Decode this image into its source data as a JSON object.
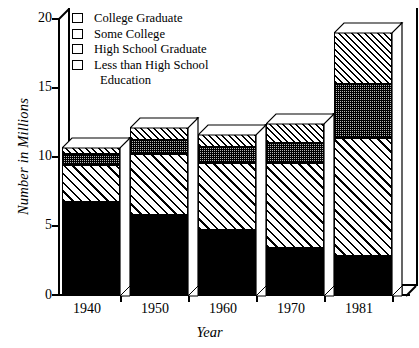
{
  "chart_data": {
    "type": "bar",
    "subtype": "stacked-bar-3d",
    "title": "",
    "xlabel": "Year",
    "ylabel": "Number in Millions",
    "categories": [
      "1940",
      "1950",
      "1960",
      "1970",
      "1981"
    ],
    "ylim": [
      0,
      20
    ],
    "yticks": [
      0,
      5,
      10,
      15,
      20
    ],
    "ytick_labels": [
      "0",
      "5",
      "10",
      "15",
      "20"
    ],
    "grid": false,
    "legend_position": "top-left",
    "stack_order_bottom_to_top": [
      "Less than High School Education",
      "High School Graduate",
      "Some College",
      "College Graduate"
    ],
    "series": [
      {
        "name": "Less than High School Education",
        "pattern": "solid-black",
        "values": [
          6.7,
          5.8,
          4.7,
          3.4,
          2.8
        ]
      },
      {
        "name": "High School Graduate",
        "pattern": "diagonal-hatch-medium",
        "values": [
          2.7,
          4.4,
          4.8,
          6.1,
          8.5
        ]
      },
      {
        "name": "Some College",
        "pattern": "gray-checker",
        "values": [
          0.8,
          1.0,
          1.2,
          1.5,
          3.9
        ]
      },
      {
        "name": "College Graduate",
        "pattern": "diagonal-hatch-dense",
        "values": [
          0.5,
          0.9,
          0.9,
          1.4,
          3.8
        ]
      }
    ],
    "cumulative_tops": {
      "1940": [
        6.7,
        9.4,
        10.2,
        10.7
      ],
      "1950": [
        5.8,
        10.2,
        11.2,
        12.1
      ],
      "1960": [
        4.7,
        9.5,
        10.7,
        11.6
      ],
      "1970": [
        3.4,
        9.5,
        11.0,
        12.4
      ],
      "1981": [
        2.8,
        11.3,
        15.2,
        19.0
      ]
    },
    "totals": [
      10.7,
      12.1,
      11.6,
      12.4,
      19.0
    ]
  },
  "legend": {
    "items": [
      {
        "label": "College Graduate",
        "swatch": "diagonal-hatch-dense"
      },
      {
        "label": "Some College",
        "swatch": "gray-checker"
      },
      {
        "label": "High School Graduate",
        "swatch": "diagonal-hatch-medium"
      },
      {
        "label": "Less than High School",
        "swatch": "solid-black"
      }
    ],
    "continuation": "Education"
  },
  "axes": {
    "y_title": "Number in Millions",
    "x_title": "Year",
    "y_labels": [
      "20",
      "15",
      "10",
      "5",
      "0"
    ],
    "x_labels": [
      "1940",
      "1950",
      "1960",
      "1970",
      "1981"
    ]
  },
  "colors": {
    "ink": "#000000",
    "paper": "#ffffff",
    "some_college_fill": "#b6b6b6"
  }
}
